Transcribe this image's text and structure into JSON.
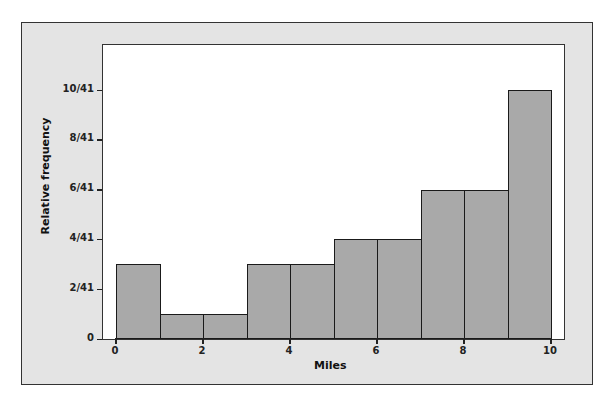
{
  "chart_data": {
    "type": "bar",
    "subtype": "histogram",
    "title": "",
    "xlabel": "Miles",
    "ylabel": "Relative frequency",
    "bin_edges": [
      0,
      1,
      2,
      3,
      4,
      5,
      6,
      7,
      8,
      9,
      10
    ],
    "categories": [
      "0-1",
      "1-2",
      "2-3",
      "3-4",
      "4-5",
      "5-6",
      "6-7",
      "7-8",
      "8-9",
      "9-10"
    ],
    "counts": [
      3,
      1,
      1,
      3,
      3,
      4,
      4,
      6,
      6,
      10
    ],
    "values": [
      0.0732,
      0.0244,
      0.0244,
      0.0732,
      0.0732,
      0.0976,
      0.0976,
      0.1463,
      0.1463,
      0.2439
    ],
    "value_labels": [
      "3/41",
      "1/41",
      "1/41",
      "3/41",
      "3/41",
      "4/41",
      "4/41",
      "6/41",
      "6/41",
      "10/41"
    ],
    "total": 41,
    "xlim": [
      0,
      10
    ],
    "ylim": [
      0,
      10.8
    ],
    "x_ticks": [
      "0",
      "2",
      "4",
      "6",
      "8",
      "10"
    ],
    "y_ticks": [
      "0",
      "2/41",
      "4/41",
      "6/41",
      "8/41",
      "10/41"
    ],
    "grid": false,
    "legend": null,
    "colors": {
      "bar_fill": "#a9a9a9",
      "bar_edge": "#1a1a1a",
      "frame_bg": "#e4e4e4",
      "plot_bg": "#ffffff"
    }
  }
}
